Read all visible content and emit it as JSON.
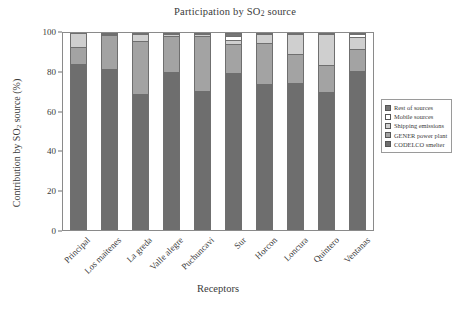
{
  "chart_data": {
    "type": "bar",
    "subtype": "stacked-vertical-100",
    "title": "Participation by SO2 source",
    "title_main": "Participation by SO",
    "title_sub": "2",
    "title_tail": " source",
    "xlabel": "Receptors",
    "ylabel": "Contribution by SO2 source (%)",
    "ylabel_main": "Contribution by SO",
    "ylabel_sub": "2",
    "ylabel_tail": " source (%)",
    "grid": false,
    "legend_position": "right",
    "ylim": [
      0,
      100
    ],
    "yticks": [
      0,
      20,
      40,
      60,
      80,
      100
    ],
    "ytick_labels": [
      "0",
      "20",
      "40",
      "60",
      "80",
      "100"
    ],
    "categories": [
      "Principal",
      "Los maitenes",
      "La greda",
      "Valle alegre",
      "Puchuncavi",
      "Sur",
      "Horcon",
      "Loncura",
      "Quintero",
      "Ventanas"
    ],
    "series": [
      {
        "name": "CODELCO smelter",
        "color": "#6e6e6e",
        "values": [
          84.3,
          81.5,
          69.2,
          80.3,
          70.6,
          79.6,
          74.2,
          74.7,
          70.4,
          80.8
        ]
      },
      {
        "name": "GENER power plant",
        "color": "#a3a3a3",
        "values": [
          8.7,
          17.3,
          26.5,
          18.4,
          27.8,
          14.7,
          20.7,
          14.9,
          13.4,
          11.5
        ]
      },
      {
        "name": "Shipping emissions",
        "color": "#cfcfcf",
        "values": [
          7.0,
          0.6,
          3.6,
          0.7,
          1.1,
          2.4,
          4.6,
          10.1,
          16.0,
          6.0
        ]
      },
      {
        "name": "Mobile sources",
        "color": "#ffffff",
        "values": [
          0.0,
          0.6,
          0.7,
          0.6,
          0.5,
          1.8,
          0.5,
          0.3,
          0.2,
          1.4
        ]
      },
      {
        "name": "Rest of sources",
        "color": "#767676",
        "values": [
          0.0,
          0.0,
          0.0,
          0.0,
          0.0,
          1.5,
          0.0,
          0.0,
          0.0,
          0.3
        ]
      }
    ],
    "legend_order": [
      "Rest of sources",
      "Mobile sources",
      "Shipping emissions",
      "GENER power plant",
      "CODELCO smelter"
    ]
  },
  "legend": {
    "items": [
      {
        "label": "Rest of sources",
        "swatch": "#767676",
        "icon": "legend-swatch-icon"
      },
      {
        "label": "Mobile sources",
        "swatch": "#ffffff",
        "icon": "legend-swatch-icon"
      },
      {
        "label": "Shipping emissions",
        "swatch": "#cfcfcf",
        "icon": "legend-swatch-icon"
      },
      {
        "label": "GENER power plant",
        "swatch": "#a3a3a3",
        "icon": "legend-swatch-icon"
      },
      {
        "label": "CODELCO smelter",
        "swatch": "#6e6e6e",
        "icon": "legend-swatch-icon"
      }
    ]
  },
  "colors": {
    "axis": "#6f6f6f",
    "text": "#3a3a3a",
    "background": "#ffffff"
  }
}
